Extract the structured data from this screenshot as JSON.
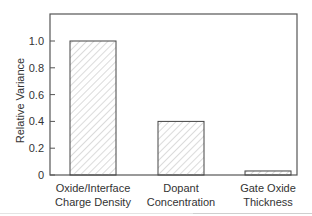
{
  "chart_data": {
    "type": "bar",
    "title": "",
    "xlabel": "",
    "ylabel": "Relative Variance",
    "categories": [
      [
        "Oxide/Interface",
        "Charge Density"
      ],
      [
        "Dopant",
        "Concentration"
      ],
      [
        "Gate Oxide",
        "Thickness"
      ]
    ],
    "values": [
      1.0,
      0.4,
      0.03
    ],
    "ylim": [
      0,
      1.2
    ],
    "yticks": [
      0,
      0.2,
      0.4,
      0.6,
      0.8,
      1.0
    ],
    "ytick_labels": [
      "0",
      "0.2",
      "0.4",
      "0.6",
      "0.8",
      "1.0"
    ],
    "grid": false,
    "legend": null,
    "bar_fill": "hatched",
    "colors": {
      "axis": "#555555",
      "bar_edge": "#444444",
      "hatch": "#b0b0b0",
      "text": "#333333"
    }
  }
}
